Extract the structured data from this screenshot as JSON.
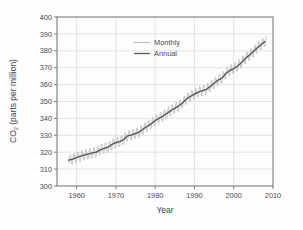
{
  "figure": {
    "background": "#fdfdfd",
    "frame_color": "#6e6e6e",
    "grid_color": "#d8d8d8"
  },
  "chart_data": {
    "type": "line",
    "title": "",
    "xlabel": "Year",
    "ylabel": "CO2 (parts per million)",
    "ylabel_main": "CO",
    "ylabel_sub": "2",
    "ylabel_rest": " (parts per million)",
    "xlim": [
      1955,
      2010
    ],
    "ylim": [
      300,
      400
    ],
    "xticks": [
      1960,
      1970,
      1980,
      1990,
      2000,
      2010
    ],
    "yticks": [
      300,
      310,
      320,
      330,
      340,
      350,
      360,
      370,
      380,
      390,
      400
    ],
    "xtick_labels": [
      "1960",
      "1970",
      "1980",
      "1990",
      "2000",
      "2010"
    ],
    "ytick_labels": [
      "300",
      "310",
      "320",
      "330",
      "340",
      "350",
      "360",
      "370",
      "380",
      "390",
      "400"
    ],
    "grid": true,
    "legend_position": "upper-center-left",
    "seasonal_amplitude_ppm": 3.1,
    "series": [
      {
        "name": "Monthly",
        "color": "#b8b8b8",
        "style": "sawtooth-seasonal-oscillation-about-annual-mean",
        "description": "Monthly mean CO2 with seasonal cycle, peak in May, trough in September"
      },
      {
        "name": "Annual",
        "color": "#5a5a5a",
        "style": "smooth-trend",
        "x": [
          1958,
          1959,
          1960,
          1961,
          1962,
          1963,
          1964,
          1965,
          1966,
          1967,
          1968,
          1969,
          1970,
          1971,
          1972,
          1973,
          1974,
          1975,
          1976,
          1977,
          1978,
          1979,
          1980,
          1981,
          1982,
          1983,
          1984,
          1985,
          1986,
          1987,
          1988,
          1989,
          1990,
          1991,
          1992,
          1993,
          1994,
          1995,
          1996,
          1997,
          1998,
          1999,
          2000,
          2001,
          2002,
          2003,
          2004,
          2005,
          2006,
          2007,
          2008
        ],
        "values": [
          315.3,
          315.9,
          316.9,
          317.6,
          318.4,
          318.9,
          319.6,
          320.0,
          321.4,
          322.2,
          323.0,
          324.6,
          325.7,
          326.3,
          327.5,
          329.7,
          330.2,
          331.1,
          332.0,
          333.8,
          335.4,
          336.8,
          338.7,
          340.1,
          341.4,
          343.0,
          344.6,
          346.0,
          347.4,
          349.2,
          351.6,
          353.1,
          354.4,
          355.6,
          356.4,
          357.1,
          358.8,
          360.8,
          362.6,
          363.8,
          366.6,
          368.3,
          369.5,
          371.0,
          373.1,
          375.6,
          377.4,
          379.6,
          381.8,
          383.7,
          385.6
        ]
      }
    ],
    "legend": [
      {
        "label": "Monthly",
        "color": "#b8b8b8"
      },
      {
        "label": "Annual",
        "color": "#5a5a5a"
      }
    ]
  }
}
